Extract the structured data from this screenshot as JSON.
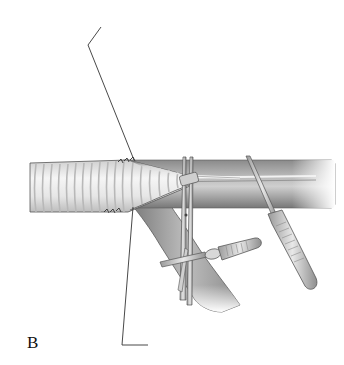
{
  "figure": {
    "panel_label": "B",
    "colors": {
      "background": "#ffffff",
      "ink": "#2a2a2a",
      "vessel_light": "#d9d9d9",
      "vessel_mid": "#9c9c9c",
      "vessel_dark": "#6e6e6e",
      "graft_rib_light": "#f4f4f4",
      "graft_rib_shadow": "#bdbdbd"
    },
    "elements": {
      "graft": "corrugated-graft",
      "host_vessel": "main-vessel",
      "branch_vessel": "branch-vessel",
      "instrument_1": "scissors",
      "instrument_2": "clamp-horizontal",
      "instrument_3": "clamp-diagonal",
      "leader_lines": [
        "leader-line-top",
        "leader-line-bottom"
      ]
    }
  }
}
